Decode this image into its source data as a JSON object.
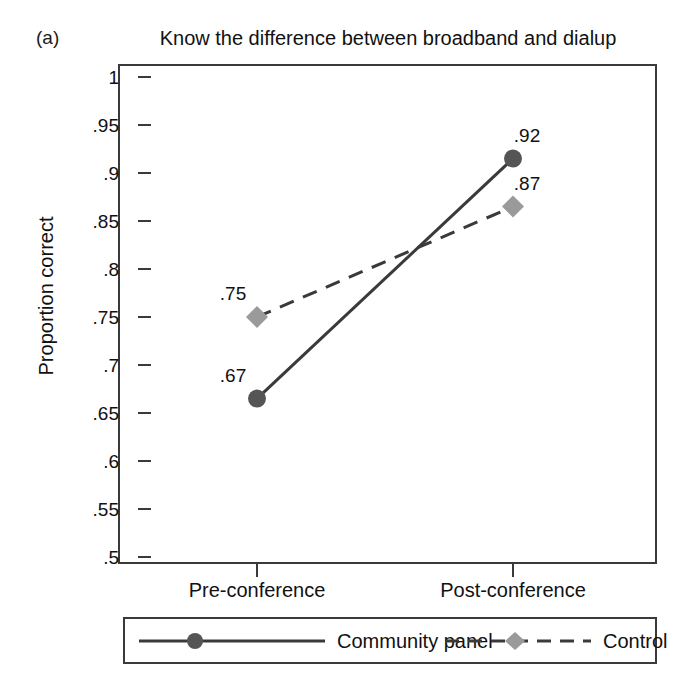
{
  "panel": {
    "letter": "(a)"
  },
  "chart_data": {
    "type": "line",
    "title": "Know the difference between broadband and dialup",
    "xlabel": "",
    "ylabel": "Proportion correct",
    "categories": [
      "Pre-conference",
      "Post-conference"
    ],
    "ylim": [
      0.5,
      1
    ],
    "ytick_labels": [
      "1",
      ".95",
      ".9",
      ".85",
      ".8",
      ".75",
      ".7",
      ".65",
      ".6",
      ".55",
      ".5"
    ],
    "ytick_values": [
      1,
      0.95,
      0.9,
      0.85,
      0.8,
      0.75,
      0.7,
      0.65,
      0.6,
      0.55,
      0.5
    ],
    "grid": false,
    "legend_position": "bottom",
    "series": [
      {
        "name": "Community panel",
        "values": [
          0.665,
          0.915
        ],
        "point_labels": [
          ".67",
          ".92"
        ],
        "line_style": "solid",
        "marker": "circle",
        "color": "#555555"
      },
      {
        "name": "Control",
        "values": [
          0.75,
          0.865
        ],
        "point_labels": [
          ".75",
          ".87"
        ],
        "line_style": "dashed",
        "marker": "diamond",
        "color": "#9a9a9a"
      }
    ]
  },
  "legend": {
    "entries": [
      {
        "label": "Community panel",
        "marker": "circle-marker-icon",
        "line": "solid-line-icon"
      },
      {
        "label": "Control",
        "marker": "diamond-marker-icon",
        "line": "dashed-line-icon"
      }
    ]
  },
  "colors": {
    "community_panel": "#555555",
    "control": "#9a9a9a",
    "axis": "#3a3a3a",
    "text": "#111111",
    "background": "#ffffff"
  }
}
